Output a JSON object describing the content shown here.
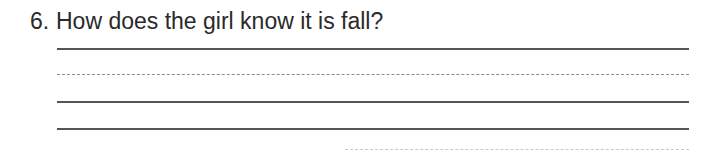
{
  "question": {
    "number": "6.",
    "text": "How does the girl know it is fall?"
  },
  "answer_lines": [
    {
      "style": "solid",
      "y": 48
    },
    {
      "style": "dashed",
      "y": 74
    },
    {
      "style": "solid",
      "y": 101
    },
    {
      "style": "solid",
      "y": 128
    }
  ]
}
